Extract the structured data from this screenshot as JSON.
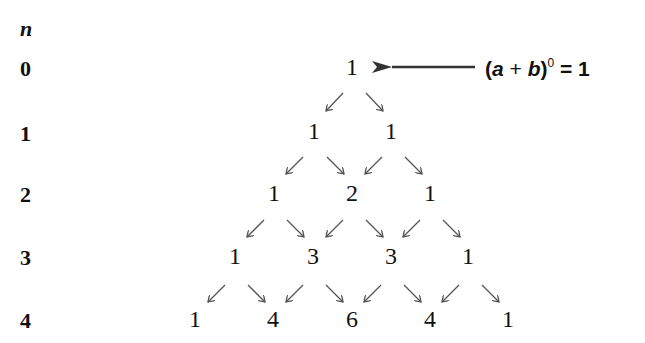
{
  "axis": {
    "label": "n"
  },
  "rows": [
    {
      "n": "0",
      "values": [
        "1"
      ]
    },
    {
      "n": "1",
      "values": [
        "1",
        "1"
      ]
    },
    {
      "n": "2",
      "values": [
        "1",
        "2",
        "1"
      ]
    },
    {
      "n": "3",
      "values": [
        "1",
        "3",
        "3",
        "1"
      ]
    },
    {
      "n": "4",
      "values": [
        "1",
        "4",
        "6",
        "4",
        "1"
      ]
    }
  ],
  "annotation": {
    "open": "(",
    "a": "a",
    "plus": " + ",
    "b": "b",
    "close": ")",
    "exponent": "0",
    "equals": " = 1"
  },
  "colors": {
    "text": "#111111",
    "arrow": "#555555"
  }
}
